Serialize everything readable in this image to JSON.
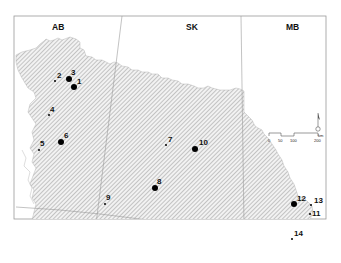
{
  "map": {
    "type": "site-location-map",
    "regions": [
      {
        "code": "AB",
        "label": "AB",
        "x": 52,
        "y": 30
      },
      {
        "code": "SK",
        "label": "SK",
        "x": 186,
        "y": 30
      },
      {
        "code": "MB",
        "label": "MB",
        "x": 286,
        "y": 30
      }
    ],
    "sites": [
      {
        "id": "1",
        "label": "1",
        "size": "large",
        "x": 74,
        "y": 87,
        "lx": 77,
        "ly": 83
      },
      {
        "id": "2",
        "label": "2",
        "size": "small",
        "x": 55,
        "y": 81,
        "lx": 57,
        "ly": 78
      },
      {
        "id": "3",
        "label": "3",
        "size": "large",
        "x": 69,
        "y": 79,
        "lx": 71,
        "ly": 74
      },
      {
        "id": "4",
        "label": "4",
        "size": "small",
        "x": 49,
        "y": 115,
        "lx": 50,
        "ly": 112
      },
      {
        "id": "5",
        "label": "5",
        "size": "small",
        "x": 39,
        "y": 150,
        "lx": 40,
        "ly": 146
      },
      {
        "id": "6",
        "label": "6",
        "size": "large",
        "x": 61,
        "y": 142,
        "lx": 64,
        "ly": 137
      },
      {
        "id": "7",
        "label": "7",
        "size": "small",
        "x": 166,
        "y": 145,
        "lx": 168,
        "ly": 141
      },
      {
        "id": "8",
        "label": "8",
        "size": "large",
        "x": 155,
        "y": 188,
        "lx": 157,
        "ly": 183
      },
      {
        "id": "9",
        "label": "9",
        "size": "small",
        "x": 105,
        "y": 204,
        "lx": 106,
        "ly": 200
      },
      {
        "id": "10",
        "label": "10",
        "size": "large",
        "x": 195,
        "y": 149,
        "lx": 199,
        "ly": 145
      },
      {
        "id": "11",
        "label": "11",
        "size": "small",
        "x": 310,
        "y": 214,
        "lx": 312,
        "ly": 216
      },
      {
        "id": "12",
        "label": "12",
        "size": "large",
        "x": 294,
        "y": 204,
        "lx": 297,
        "ly": 200
      },
      {
        "id": "13",
        "label": "13",
        "size": "small",
        "x": 311,
        "y": 205,
        "lx": 314,
        "ly": 203
      },
      {
        "id": "14",
        "label": "14",
        "size": "small",
        "x": 292,
        "y": 239,
        "lx": 294,
        "ly": 236
      }
    ],
    "scale_bar": {
      "ticks": [
        "0",
        "50",
        "100",
        "200"
      ],
      "unit": "km"
    },
    "north_arrow": {
      "label": "N"
    },
    "colors": {
      "hatch": "#8a8a8a",
      "hatch_bg": "#f2f2f2",
      "border": "#9a9a9a",
      "point": "#000000"
    }
  }
}
